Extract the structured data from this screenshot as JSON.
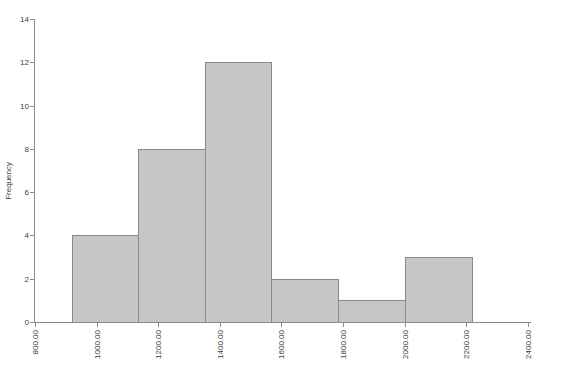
{
  "chart_data": {
    "type": "bar",
    "subtype": "histogram",
    "title": "",
    "xlabel": "",
    "ylabel": "Frequency",
    "ylim": [
      0,
      14
    ],
    "y_ticks": [
      0,
      2,
      4,
      6,
      8,
      10,
      12,
      14
    ],
    "xlim": [
      800,
      2410
    ],
    "x_ticks": [
      {
        "value": 800,
        "label": "800.00"
      },
      {
        "value": 1000,
        "label": "1000.00"
      },
      {
        "value": 1200,
        "label": "1200.00"
      },
      {
        "value": 1400,
        "label": "1400.00"
      },
      {
        "value": 1600,
        "label": "1600.00"
      },
      {
        "value": 1800,
        "label": "1800.00"
      },
      {
        "value": 2000,
        "label": "2000.00"
      },
      {
        "value": 2200,
        "label": "2200.00"
      },
      {
        "value": 2400,
        "label": "2400.00"
      }
    ],
    "bins": {
      "edges": [
        920,
        1137,
        1354,
        1571,
        1788,
        2005,
        2222
      ],
      "frequencies": [
        4,
        8,
        12,
        2,
        1,
        3
      ]
    },
    "grid": false,
    "legend": null,
    "colors": {
      "background": "#ffffff",
      "bar_fill": "#c5c7c5",
      "bar_border": "#8a8a8a",
      "axis": "#8a8a8a",
      "text": "#3d3d3d"
    }
  }
}
